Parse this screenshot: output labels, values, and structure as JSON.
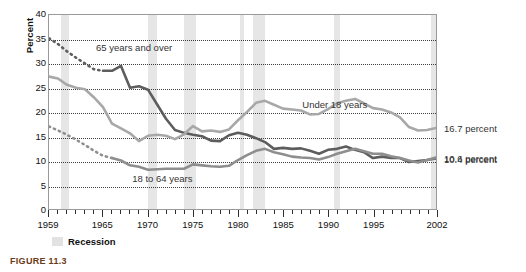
{
  "figure": {
    "caption": "FIGURE 11.3"
  },
  "legend": {
    "recession_label": "Recession",
    "recession_color": "#e6e6e6"
  },
  "callouts": [
    {
      "name": "under-18-value",
      "text": "16.7 percent",
      "y_value": 16.7
    },
    {
      "name": "aged-65-value",
      "text": "10.6 percent",
      "y_value": 10.6
    },
    {
      "name": "aged-18-64-value",
      "text": "10.4 percent",
      "y_value": 10.4
    }
  ],
  "series_labels": [
    {
      "name": "label-65-and-over",
      "text": "65 years and over",
      "x": 1964.2,
      "y": 33.2
    },
    {
      "name": "label-under-18",
      "text": "Under 18 years",
      "x": 1987.0,
      "y": 21.6
    },
    {
      "name": "label-18-to-64",
      "text": "18 to 64 years",
      "x": 1968.2,
      "y": 6.6
    }
  ],
  "chart_data": {
    "type": "line",
    "title": "",
    "xlabel": "",
    "ylabel": "Percent",
    "xlim": [
      1959,
      2002
    ],
    "ylim": [
      0,
      40
    ],
    "ytick_values": [
      0,
      5,
      10,
      15,
      20,
      25,
      30,
      35,
      40
    ],
    "ytick_labels": [
      "0",
      "5",
      "10",
      "15",
      "20",
      "25",
      "30",
      "35",
      "40"
    ],
    "xtick_values": [
      1959,
      1965,
      1970,
      1975,
      1980,
      1985,
      1990,
      1995,
      2002
    ],
    "xtick_labels": [
      "1959",
      "1965",
      "1970",
      "1975",
      "1980",
      "1985",
      "1990",
      "1995",
      "2002"
    ],
    "xtick_minor_step": 1,
    "grid": "horizontal-dotted",
    "legend_position": "below-axis-left",
    "shaded_regions_label": "Recession",
    "shaded_regions": [
      {
        "start": 1960.3,
        "end": 1961.2
      },
      {
        "start": 1969.9,
        "end": 1970.9
      },
      {
        "start": 1973.9,
        "end": 1975.2
      },
      {
        "start": 1980.1,
        "end": 1980.6
      },
      {
        "start": 1981.5,
        "end": 1982.9
      },
      {
        "start": 1990.5,
        "end": 1991.2
      },
      {
        "start": 2001.2,
        "end": 2001.9
      }
    ],
    "series": [
      {
        "name": "65 years and over",
        "color": "#5d5d5d",
        "width": 2.6,
        "dashed_range": [
          1959,
          1965
        ],
        "x": [
          1959,
          1960,
          1961,
          1962,
          1963,
          1964,
          1965,
          1966,
          1967,
          1968,
          1969,
          1970,
          1971,
          1972,
          1973,
          1974,
          1975,
          1976,
          1977,
          1978,
          1979,
          1980,
          1981,
          1982,
          1983,
          1984,
          1985,
          1986,
          1987,
          1988,
          1989,
          1990,
          1991,
          1992,
          1993,
          1994,
          1995,
          1996,
          1997,
          1998,
          1999,
          2000,
          2001,
          2002
        ],
        "values": [
          35.2,
          34.0,
          32.5,
          31.2,
          30.0,
          28.8,
          28.5,
          28.5,
          29.5,
          25.0,
          25.3,
          24.6,
          21.6,
          18.6,
          16.3,
          15.7,
          15.3,
          15.0,
          14.1,
          14.0,
          15.2,
          15.7,
          15.3,
          14.6,
          13.8,
          12.4,
          12.6,
          12.4,
          12.5,
          12.0,
          11.4,
          12.2,
          12.4,
          12.9,
          12.2,
          11.7,
          10.5,
          10.8,
          10.5,
          10.5,
          9.7,
          9.9,
          10.1,
          10.4
        ],
        "endpoint_label": "10.4 percent"
      },
      {
        "name": "Under 18 years",
        "color": "#a8a8a8",
        "width": 2.6,
        "dashed_range": null,
        "x": [
          1959,
          1960,
          1961,
          1962,
          1963,
          1964,
          1965,
          1966,
          1967,
          1968,
          1969,
          1970,
          1971,
          1972,
          1973,
          1974,
          1975,
          1976,
          1977,
          1978,
          1979,
          1980,
          1981,
          1982,
          1983,
          1984,
          1985,
          1986,
          1987,
          1988,
          1989,
          1990,
          1991,
          1992,
          1993,
          1994,
          1995,
          1996,
          1997,
          1998,
          1999,
          2000,
          2001,
          2002
        ],
        "values": [
          27.3,
          26.9,
          25.6,
          25.0,
          24.7,
          23.0,
          21.0,
          17.6,
          16.6,
          15.6,
          14.0,
          15.1,
          15.3,
          15.1,
          14.4,
          15.4,
          17.1,
          16.0,
          16.2,
          15.9,
          16.4,
          18.3,
          20.0,
          21.9,
          22.3,
          21.5,
          20.7,
          20.5,
          20.3,
          19.5,
          19.6,
          20.6,
          21.8,
          22.3,
          22.7,
          21.8,
          20.8,
          20.5,
          19.9,
          18.9,
          16.9,
          16.2,
          16.3,
          16.7
        ],
        "endpoint_label": "16.7 percent"
      },
      {
        "name": "18 to 64 years",
        "color": "#8e8e8e",
        "width": 2.6,
        "dashed_range": [
          1959,
          1966
        ],
        "x": [
          1959,
          1960,
          1961,
          1962,
          1963,
          1964,
          1965,
          1966,
          1967,
          1968,
          1969,
          1970,
          1971,
          1972,
          1973,
          1974,
          1975,
          1976,
          1977,
          1978,
          1979,
          1980,
          1981,
          1982,
          1983,
          1984,
          1985,
          1986,
          1987,
          1988,
          1989,
          1990,
          1991,
          1992,
          1993,
          1994,
          1995,
          1996,
          1997,
          1998,
          1999,
          2000,
          2001,
          2002
        ],
        "values": [
          17.0,
          16.2,
          15.3,
          14.3,
          13.2,
          12.0,
          11.0,
          10.5,
          10.0,
          9.0,
          8.7,
          8.1,
          8.2,
          8.3,
          8.3,
          8.3,
          9.2,
          9.0,
          8.8,
          8.7,
          8.9,
          10.1,
          11.1,
          12.0,
          12.4,
          11.7,
          11.3,
          10.8,
          10.6,
          10.5,
          10.2,
          10.7,
          11.4,
          11.9,
          12.4,
          11.9,
          11.4,
          11.4,
          10.9,
          10.5,
          10.0,
          9.6,
          10.1,
          10.6
        ],
        "endpoint_label": "10.6 percent"
      }
    ]
  }
}
